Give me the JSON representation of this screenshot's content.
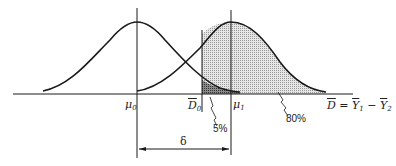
{
  "diagram": {
    "type": "two overlapping normal distributions (power / significance illustration)",
    "colors": {
      "line": "#1a1a1a",
      "shade_light": "#d9d9d9",
      "shade_dark": "#6e6e6e"
    },
    "labels": {
      "mu0": "μ",
      "mu0_sub": "0",
      "D0": "D",
      "D0_sub": "0",
      "mu1": "μ",
      "mu1_sub": "1",
      "axis_var_D": "D",
      "axis_eq": " = ",
      "axis_Y1": "Y",
      "axis_Y1_sub": "1",
      "axis_minus": " − ",
      "axis_Y2": "Y",
      "axis_Y2_sub": "2",
      "alpha": "5%",
      "power": "80%",
      "delta": "δ"
    }
  }
}
